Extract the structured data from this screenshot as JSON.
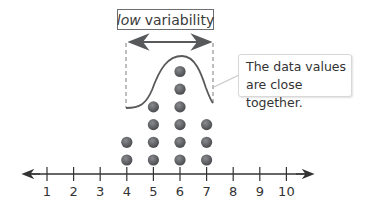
{
  "title": {
    "italic": "low",
    "rest": "variability"
  },
  "callout": {
    "line1": "The data values",
    "line2": "are close together."
  },
  "colors": {
    "dot": "#5a5b5e",
    "axis": "#333333",
    "curve": "#58595b",
    "dashed": "#9a9a9a",
    "box_border": "#6d6e71"
  },
  "chart_data": {
    "type": "scatter",
    "subtype": "dot plot",
    "title": "low variability",
    "annotation": "The data values are close together.",
    "xlabel": "",
    "ylabel": "",
    "x_ticks": [
      1,
      2,
      3,
      4,
      5,
      6,
      7,
      8,
      9,
      10
    ],
    "xlim": [
      0.5,
      11
    ],
    "grid": false,
    "categories": [
      4,
      5,
      6,
      7
    ],
    "values": [
      2,
      4,
      6,
      3
    ],
    "overlay": "bell-shaped curve spanning x=4 to x=7, peak at x=6",
    "bracket": "double-headed arrow spanning x=4 to x=7"
  }
}
